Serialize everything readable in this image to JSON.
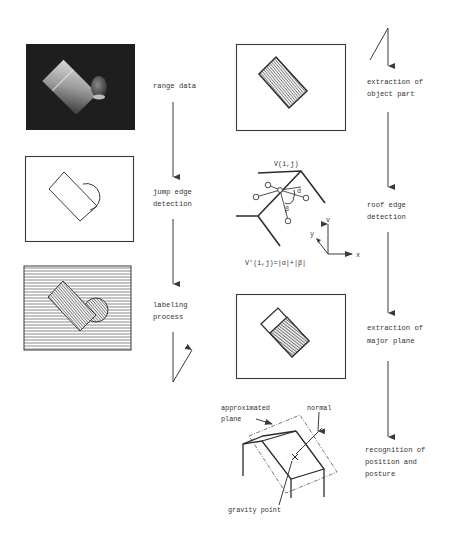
{
  "diagram": {
    "type": "process-flow",
    "colors": {
      "background": "#ffffff",
      "line": "#3a3a3a",
      "text": "#333333",
      "range_image_bg": "#1e1e1e"
    },
    "left_column": {
      "steps": [
        {
          "id": "range",
          "label": "range data"
        },
        {
          "id": "jump",
          "label_line1": "jump edge",
          "label_line2": "detection"
        },
        {
          "id": "labeling",
          "label_line1": "labeling",
          "label_line2": "process"
        }
      ],
      "panels": [
        {
          "id": "range-image",
          "description": "grayscale range image of box and cylinder"
        },
        {
          "id": "edge-image",
          "description": "outline of rectangle and circle"
        },
        {
          "id": "labeled-image",
          "description": "hatched labeled regions"
        }
      ]
    },
    "right_column": {
      "steps": [
        {
          "id": "object",
          "label_line1": "extraction of",
          "label_line2": "object part"
        },
        {
          "id": "roof",
          "label_line1": "roof edge",
          "label_line2": "detection"
        },
        {
          "id": "major",
          "label_line1": "extraction of",
          "label_line2": "major plane"
        },
        {
          "id": "recognition",
          "label_line1": "recognition of",
          "label_line2": "position and",
          "label_line3": "posture"
        }
      ],
      "panels": [
        {
          "id": "object-part-image",
          "description": "hatched rotated rectangle"
        },
        {
          "id": "major-plane-image",
          "description": "rectangle with major plane hatched"
        }
      ]
    },
    "roof_edge_figure": {
      "v_label": "V(i,j)",
      "formula": "V'(i,j)=|α|+|β|",
      "alpha": "α",
      "beta": "β",
      "axes": {
        "x": "x",
        "y": "y",
        "v": "v"
      }
    },
    "posture_figure": {
      "approx_plane_line1": "approximated",
      "approx_plane_line2": "plane",
      "normal": "normal",
      "gravity_point": "gravity point"
    }
  }
}
